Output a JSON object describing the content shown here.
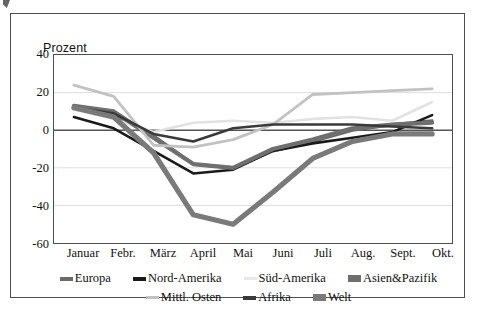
{
  "chart_data": {
    "type": "line",
    "title": "",
    "ylabel": "Prozent",
    "xlabel": "",
    "ylim": [
      -60,
      40
    ],
    "yticks": [
      40,
      20,
      0,
      -20,
      -40,
      -60
    ],
    "grid": true,
    "legend_position": "bottom",
    "categories": [
      "Januar",
      "Febr.",
      "März",
      "April",
      "Mai",
      "Juni",
      "Juli",
      "Aug.",
      "Sept.",
      "Okt."
    ],
    "series": [
      {
        "name": "Europa",
        "color": "#6b6b6b",
        "width": 3.2,
        "values": [
          12,
          8,
          -3,
          -18,
          -20,
          -11,
          -6,
          0,
          3,
          5
        ]
      },
      {
        "name": "Nord-Amerika",
        "color": "#1a1a1a",
        "width": 2.6,
        "values": [
          7,
          1,
          -11,
          -23,
          -21,
          -11,
          -7,
          -4,
          -1,
          8
        ]
      },
      {
        "name": "Süd-Amerika",
        "color": "#e2e2e2",
        "width": 2.6,
        "values": [
          11,
          6,
          -1,
          4,
          5,
          4,
          6,
          7,
          5,
          15
        ]
      },
      {
        "name": "Asien&Pazifik",
        "color": "#6f6f6f",
        "width": 4.2,
        "values": [
          13,
          10,
          -4,
          -18,
          -20,
          -10,
          -5,
          1,
          3,
          4
        ]
      },
      {
        "name": "Mittl. Osten",
        "color": "#c2c2c2",
        "width": 2.8,
        "values": [
          24,
          18,
          -8,
          -9,
          -5,
          3,
          19,
          20,
          21,
          22
        ]
      },
      {
        "name": "Afrika",
        "color": "#3a3a3a",
        "width": 2.6,
        "values": [
          12,
          9,
          -2,
          -6,
          1,
          3,
          3,
          3,
          2,
          1
        ]
      },
      {
        "name": "Welt",
        "color": "#7a7a7a",
        "width": 5.2,
        "values": [
          12,
          7,
          -12,
          -45,
          -50,
          -33,
          -15,
          -6,
          -2,
          -2
        ]
      }
    ]
  },
  "legend": {
    "rows": [
      [
        {
          "label": "Europa",
          "color": "#6b6b6b",
          "style": "medium"
        },
        {
          "label": "Nord-Amerika",
          "color": "#1a1a1a",
          "style": "medium"
        },
        {
          "label": "Süd-Amerika",
          "color": "#e8e8e8",
          "style": "thin"
        },
        {
          "label": "Asien&Pazifik",
          "color": "#6f6f6f",
          "style": "thick"
        }
      ],
      [
        {
          "label": "Mittl. Osten",
          "color": "#c2c2c2",
          "style": "thin"
        },
        {
          "label": "Afrika",
          "color": "#3a3a3a",
          "style": "medium"
        },
        {
          "label": "Welt",
          "color": "#7a7a7a",
          "style": "thick"
        }
      ]
    ]
  },
  "colors": {
    "frame": "#4d4d4d",
    "grid": "#d9d9d9",
    "zero_axis": "#555555",
    "background": "#ffffff"
  }
}
